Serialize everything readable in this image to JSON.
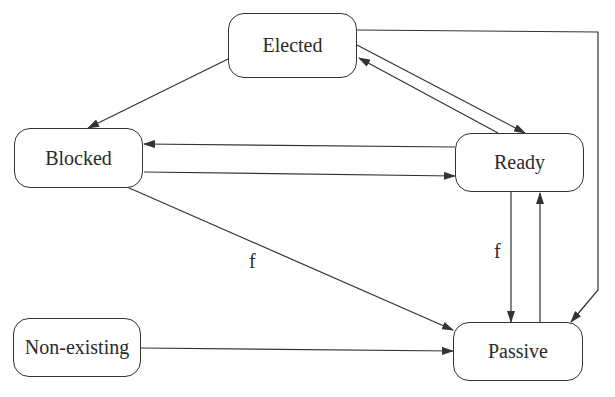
{
  "diagram": {
    "states": [
      {
        "id": "elected",
        "label": "Elected"
      },
      {
        "id": "blocked",
        "label": "Blocked"
      },
      {
        "id": "ready",
        "label": "Ready"
      },
      {
        "id": "non_existing",
        "label": "Non-existing"
      },
      {
        "id": "passive",
        "label": "Passive"
      }
    ],
    "edges": [
      {
        "from": "Elected",
        "to": "Blocked",
        "label": ""
      },
      {
        "from": "Elected",
        "to": "Ready",
        "label": ""
      },
      {
        "from": "Ready",
        "to": "Elected",
        "label": ""
      },
      {
        "from": "Elected",
        "to": "Passive",
        "label": ""
      },
      {
        "from": "Ready",
        "to": "Blocked",
        "label": ""
      },
      {
        "from": "Blocked",
        "to": "Ready",
        "label": ""
      },
      {
        "from": "Blocked",
        "to": "Passive",
        "label": "f"
      },
      {
        "from": "Ready",
        "to": "Passive",
        "label": "f"
      },
      {
        "from": "Passive",
        "to": "Ready",
        "label": ""
      },
      {
        "from": "Non-existing",
        "to": "Passive",
        "label": ""
      }
    ],
    "edge_labels": {
      "blocked_passive": "f",
      "ready_passive": "f"
    },
    "line_color": "#333333"
  }
}
